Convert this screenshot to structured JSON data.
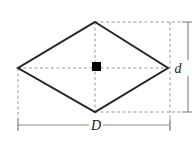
{
  "figure": {
    "shape": "rhombus",
    "colors": {
      "outline": "#262626",
      "construction": "#9a9a9a",
      "dimension": "#8c8c8c",
      "center_marker": "#000000",
      "background": "#ffffff"
    },
    "geometry": {
      "top_vertex": [
        95,
        22
      ],
      "right_vertex": [
        168,
        68
      ],
      "bottom_vertex": [
        95,
        112
      ],
      "left_vertex": [
        18,
        68
      ],
      "center": [
        95,
        68
      ],
      "long_diagonal_label": "D",
      "short_diagonal_label": "d"
    },
    "labels": {
      "long_diagonal": "D",
      "short_diagonal": "d"
    },
    "markers": {
      "center_square": "center-point-marker"
    },
    "dimension_lines": {
      "horizontal": {
        "name": "D",
        "y": 125,
        "x_start": 18,
        "x_end": 170
      },
      "vertical": {
        "name": "d",
        "x": 188,
        "y_start": 22,
        "y_end": 112
      }
    }
  }
}
